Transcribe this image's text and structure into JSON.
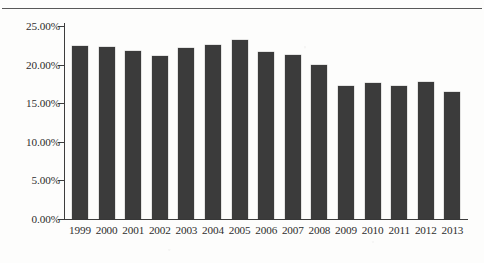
{
  "chart_data": {
    "type": "bar",
    "title": "",
    "subtitle": "",
    "xlabel": "",
    "ylabel": "",
    "categories": [
      "1999",
      "2000",
      "2001",
      "2002",
      "2003",
      "2004",
      "2005",
      "2006",
      "2007",
      "2008",
      "2009",
      "2010",
      "2011",
      "2012",
      "2013"
    ],
    "values": [
      22.4,
      22.3,
      21.7,
      21.1,
      22.1,
      22.6,
      23.2,
      21.6,
      21.3,
      19.9,
      17.2,
      17.6,
      17.2,
      17.8,
      16.4
    ],
    "value_labels": [
      "22.40%",
      "22.30%",
      "21.70%",
      "21.10%",
      "22.10%",
      "22.60%",
      "23.20%",
      "21.60%",
      "21.30%",
      "19.90%",
      "17.20%",
      "17.60%",
      "17.20%",
      "17.80%",
      "16.40%"
    ],
    "ylim": [
      0,
      25
    ],
    "ytick_values": [
      0,
      5,
      10,
      15,
      20,
      25
    ],
    "ytick_labels": [
      "0.00%",
      "5.00%",
      "10.00%",
      "15.00%",
      "20.00%",
      "25.00%"
    ],
    "grid": false,
    "legend": null,
    "legend_position": "none",
    "series": [
      {
        "name": "",
        "values": [
          22.4,
          22.3,
          21.7,
          21.1,
          22.1,
          22.6,
          23.2,
          21.6,
          21.3,
          19.9,
          17.2,
          17.6,
          17.2,
          17.8,
          16.4
        ]
      }
    ],
    "bar_color": "#3b3b3b",
    "axis_color": "#3d3d3d",
    "background_color": "#fdfdfc"
  },
  "annotations": {
    "top_rule": ""
  }
}
